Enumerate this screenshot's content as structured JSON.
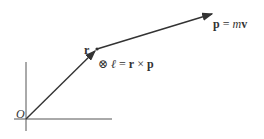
{
  "diagram": {
    "origin_label": "O",
    "r_label": "r",
    "angular_momentum": {
      "symbol": "⊗",
      "ell": "ℓ",
      "equals": " = ",
      "r": "r",
      "cross": " × ",
      "p": "p"
    },
    "momentum": {
      "p": "p",
      "equals": " = ",
      "m": "m",
      "v": "v"
    },
    "colors": {
      "line": "#333333",
      "axis": "#555555"
    }
  }
}
